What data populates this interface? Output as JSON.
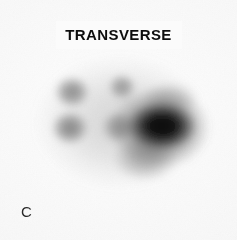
{
  "figure": {
    "title": "TRANSVERSE",
    "panel_label": "C",
    "modality": "scintigraphy",
    "background_color": "#f8f8f8",
    "ink_color": "#0e0e0e",
    "width": 237,
    "height": 240
  },
  "chart_data": {
    "type": "heatmap",
    "title": "TRANSVERSE",
    "subtitle": "",
    "xlabel": "",
    "ylabel": "",
    "annotations": [
      "C"
    ],
    "legend": [],
    "grid": false,
    "colormap": "grayscale-inverted",
    "colormap_stops": [
      "#f8f8f8",
      "#c9c9c9",
      "#8e8e8e",
      "#555555",
      "#1d1d1d",
      "#050505"
    ],
    "field_extent": {
      "x0": 36,
      "y0": 56,
      "x1": 208,
      "y1": 192
    },
    "intensity_scale": {
      "min": 0,
      "max": 100,
      "units": "relative counts"
    },
    "hotspots": [
      {
        "name": "diffuse-body-halo",
        "cx": 120,
        "cy": 122,
        "rx": 88,
        "ry": 69,
        "intensity": 22
      },
      {
        "name": "left-superior-focus",
        "cx": 72,
        "cy": 92,
        "rx": 19,
        "ry": 17,
        "intensity": 52
      },
      {
        "name": "left-inferior-focus",
        "cx": 70,
        "cy": 128,
        "rx": 20,
        "ry": 18,
        "intensity": 54
      },
      {
        "name": "mid-superior-focus",
        "cx": 122,
        "cy": 87,
        "rx": 15,
        "ry": 14,
        "intensity": 46
      },
      {
        "name": "mid-inferior-focus",
        "cx": 118,
        "cy": 127,
        "rx": 18,
        "ry": 17,
        "intensity": 44
      },
      {
        "name": "right-dominant-core",
        "cx": 162,
        "cy": 126,
        "rx": 36,
        "ry": 25,
        "intensity": 100
      },
      {
        "name": "right-core-penumbra",
        "cx": 160,
        "cy": 128,
        "rx": 52,
        "ry": 42,
        "intensity": 62
      },
      {
        "name": "right-inferior-tail",
        "cx": 145,
        "cy": 158,
        "rx": 34,
        "ry": 24,
        "intensity": 38
      },
      {
        "name": "right-superior-shoulder",
        "cx": 170,
        "cy": 100,
        "rx": 30,
        "ry": 20,
        "intensity": 30
      }
    ]
  }
}
